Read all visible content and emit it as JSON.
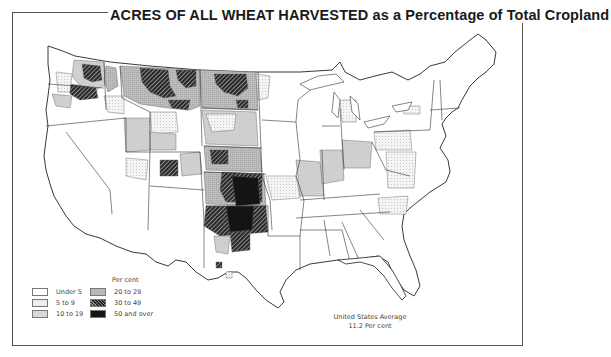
{
  "title": {
    "caps": "ACRES OF ALL WHEAT HARVESTED",
    "rest": "as a Percentage of Total Cropland"
  },
  "legend": {
    "title": "Per cent",
    "items": [
      {
        "label": "Under 5",
        "pattern": "white"
      },
      {
        "label": "5 to 9",
        "pattern": "light-dots"
      },
      {
        "label": "10 to 19",
        "pattern": "medium-dots"
      },
      {
        "label": "20 to 29",
        "pattern": "grey-fine"
      },
      {
        "label": "30 to 49",
        "pattern": "dark-hatch"
      },
      {
        "label": "50 and over",
        "pattern": "black"
      }
    ]
  },
  "average": {
    "line1": "United States Average",
    "line2": "11.2 Per cent"
  },
  "colors": {
    "under5": "#ffffff",
    "c5to9": "#ececec",
    "c10to19": "#d4d4d4",
    "c20to29": "#b8b8b8",
    "c30to49": "#4a4a4a",
    "c50over": "#141414",
    "border": "#333333"
  },
  "map": {
    "subject": "Contiguous United States by county groups",
    "high_regions": [
      "Montana north-central",
      "Eastern Washington Palouse",
      "North Dakota",
      "Western Kansas",
      "Oklahoma panhandle and north Texas panhandle"
    ]
  }
}
